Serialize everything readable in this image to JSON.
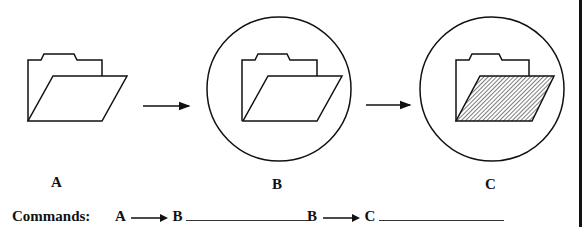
{
  "panels": [
    {
      "id": "A",
      "label": "A",
      "state": "plain-folder"
    },
    {
      "id": "B",
      "label": "B",
      "state": "folder-selected-circle"
    },
    {
      "id": "C",
      "label": "C",
      "state": "folder-hatched-circle"
    }
  ],
  "commands": {
    "title": "Commands:",
    "first": {
      "from": "A",
      "to": "B",
      "answer": ""
    },
    "second": {
      "from": "B",
      "to": "C",
      "answer": ""
    }
  },
  "colors": {
    "stroke": "#111111",
    "background": "#ffffff"
  }
}
